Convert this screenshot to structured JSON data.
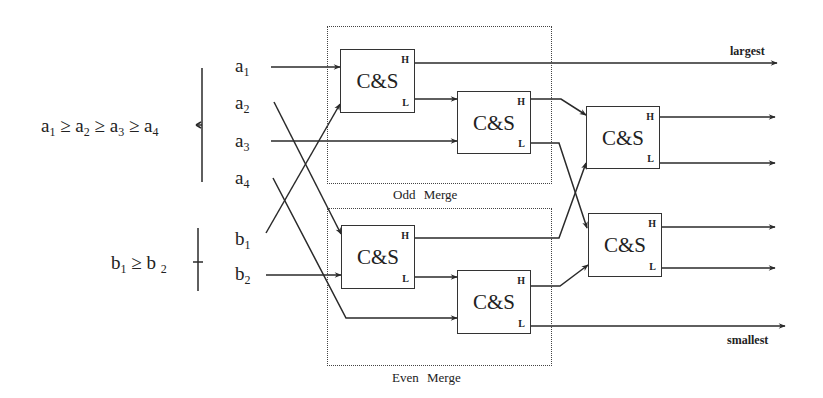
{
  "diagram": {
    "type": "sorting-network",
    "inputs": {
      "a": [
        {
          "id": "a1",
          "base": "a",
          "sub": "1"
        },
        {
          "id": "a2",
          "base": "a",
          "sub": "2"
        },
        {
          "id": "a3",
          "base": "a",
          "sub": "3"
        },
        {
          "id": "a4",
          "base": "a",
          "sub": "4"
        }
      ],
      "b": [
        {
          "id": "b1",
          "base": "b",
          "sub": "1"
        },
        {
          "id": "b2",
          "base": "b",
          "sub": "2"
        }
      ]
    },
    "conditions": {
      "a": {
        "parts": [
          "a",
          "1",
          " ≥ a",
          "2",
          " ≥ a",
          "3",
          " ≥ a",
          "4"
        ]
      },
      "b": {
        "parts": [
          "b",
          "1",
          " ≥ b ",
          "2"
        ]
      }
    },
    "merges": {
      "odd": {
        "label": "Odd Merge"
      },
      "even": {
        "label": "Even Merge"
      }
    },
    "units": [
      {
        "id": "cs1",
        "label": "C&S",
        "high": "H",
        "low": "L"
      },
      {
        "id": "cs2",
        "label": "C&S",
        "high": "H",
        "low": "L"
      },
      {
        "id": "cs3",
        "label": "C&S",
        "high": "H",
        "low": "L"
      },
      {
        "id": "cs4",
        "label": "C&S",
        "high": "H",
        "low": "L"
      },
      {
        "id": "cs5",
        "label": "C&S",
        "high": "H",
        "low": "L"
      },
      {
        "id": "cs6",
        "label": "C&S",
        "high": "H",
        "low": "L"
      }
    ],
    "outputs": {
      "largest": "largest",
      "smallest": "smallest"
    },
    "colors": {
      "line": "#2a2a2a",
      "background": "#ffffff"
    }
  }
}
